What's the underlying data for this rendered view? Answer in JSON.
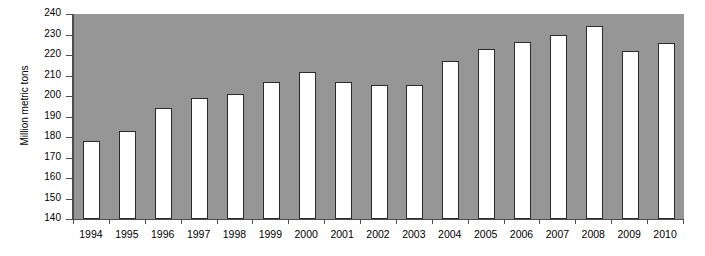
{
  "chart_data": {
    "type": "bar",
    "title": "",
    "xlabel": "",
    "ylabel": "Million metric tons",
    "ylim": [
      140,
      240
    ],
    "ytick_step": 10,
    "yticks": [
      240,
      230,
      220,
      210,
      200,
      190,
      180,
      170,
      160,
      150,
      140
    ],
    "grid": false,
    "legend": null,
    "categories": [
      "1994",
      "1995",
      "1996",
      "1997",
      "1998",
      "1999",
      "2000",
      "2001",
      "2002",
      "2003",
      "2004",
      "2005",
      "2006",
      "2007",
      "2008",
      "2009",
      "2010"
    ],
    "values": [
      178,
      183,
      194,
      199,
      201,
      207,
      211.5,
      207,
      205.5,
      205.5,
      217,
      223,
      226.5,
      230,
      234,
      222,
      226
    ],
    "colors": {
      "plot_background": "#969696",
      "bar_fill": "#ffffff",
      "bar_border": "#2b2b2b",
      "axis": "#4d4d4d",
      "text": "#000000",
      "page_background": "#ffffff"
    }
  }
}
